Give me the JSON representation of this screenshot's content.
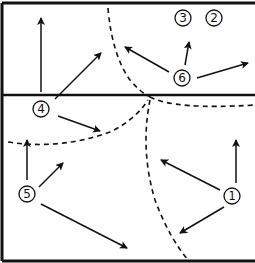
{
  "diagram": {
    "colors": {
      "line": "#111111",
      "background": "#ffffff"
    },
    "court": {
      "top": 3,
      "bottom": 261,
      "left": 2,
      "right": 255,
      "net_y": 95
    },
    "players": [
      {
        "id": "p1",
        "label": "1",
        "x": 232,
        "y": 196
      },
      {
        "id": "p2",
        "label": "2",
        "x": 214,
        "y": 18
      },
      {
        "id": "p3",
        "label": "3",
        "x": 183,
        "y": 18
      },
      {
        "id": "p4",
        "label": "4",
        "x": 41,
        "y": 109
      },
      {
        "id": "p5",
        "label": "5",
        "x": 27,
        "y": 194
      },
      {
        "id": "p6",
        "label": "6",
        "x": 182,
        "y": 78
      }
    ],
    "arrows": [
      {
        "from": "p4",
        "x1": 41,
        "y1": 92,
        "x2": 41,
        "y2": 18
      },
      {
        "from": "p4",
        "x1": 55,
        "y1": 99,
        "x2": 101,
        "y2": 53
      },
      {
        "from": "p4",
        "x1": 58,
        "y1": 116,
        "x2": 100,
        "y2": 131
      },
      {
        "from": "p6",
        "x1": 169,
        "y1": 72,
        "x2": 125,
        "y2": 47
      },
      {
        "from": "p6",
        "x1": 185,
        "y1": 65,
        "x2": 189,
        "y2": 42
      },
      {
        "from": "p6",
        "x1": 197,
        "y1": 78,
        "x2": 248,
        "y2": 63
      },
      {
        "from": "p5",
        "x1": 27,
        "y1": 180,
        "x2": 27,
        "y2": 140
      },
      {
        "from": "p5",
        "x1": 39,
        "y1": 187,
        "x2": 63,
        "y2": 163
      },
      {
        "from": "p5",
        "x1": 41,
        "y1": 204,
        "x2": 127,
        "y2": 248
      },
      {
        "from": "p1",
        "x1": 236,
        "y1": 183,
        "x2": 236,
        "y2": 140
      },
      {
        "from": "p1",
        "x1": 220,
        "y1": 190,
        "x2": 161,
        "y2": 160
      },
      {
        "from": "p1",
        "x1": 224,
        "y1": 207,
        "x2": 180,
        "y2": 233
      }
    ],
    "dashed_lines": [
      {
        "id": "upper-left-boundary",
        "d": "M108 8 Q112 55 130 80 Q140 92 150 97"
      },
      {
        "id": "net-right-boundary",
        "d": "M150 97 Q175 110 255 105"
      },
      {
        "id": "back-left-boundary",
        "d": "M8 142 Q60 150 110 132 Q135 120 148 100"
      },
      {
        "id": "back-right-boundary",
        "d": "M150 100 Q140 150 155 200 Q170 240 190 262"
      }
    ]
  }
}
